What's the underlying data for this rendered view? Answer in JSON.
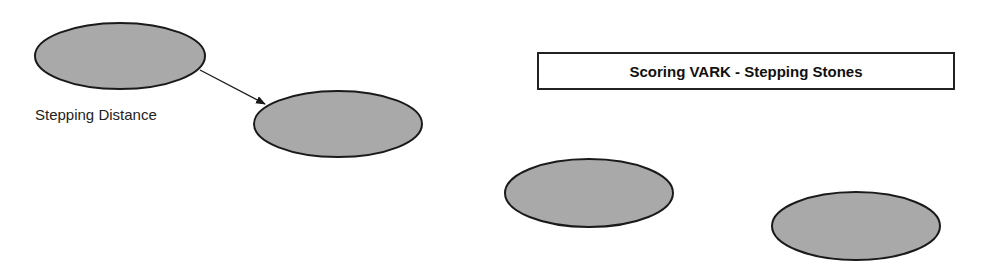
{
  "title": "Scoring VARK - Stepping Stones",
  "arrow_label": "Stepping Distance",
  "colors": {
    "stone_fill": "#a9a9a9",
    "stroke": "#1a1a1a",
    "background": "#ffffff"
  },
  "stones": [
    {
      "id": 1,
      "cx": 120,
      "cy": 56,
      "rx": 85,
      "ry": 33
    },
    {
      "id": 2,
      "cx": 338,
      "cy": 124,
      "rx": 84,
      "ry": 33
    },
    {
      "id": 3,
      "cx": 589,
      "cy": 193,
      "rx": 84,
      "ry": 34
    },
    {
      "id": 4,
      "cx": 856,
      "cy": 226,
      "rx": 84,
      "ry": 34
    }
  ],
  "arrow": {
    "from": [
      200,
      70
    ],
    "to": [
      265,
      104
    ]
  }
}
